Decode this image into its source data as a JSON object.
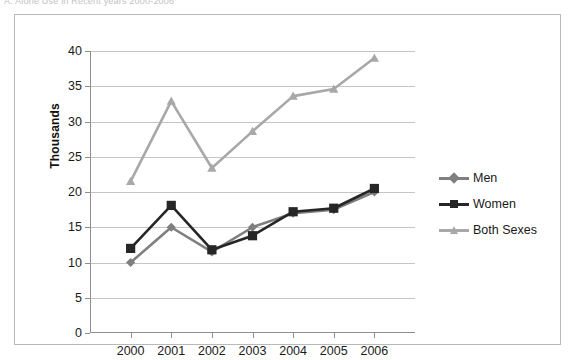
{
  "caption": "A. Alone Use in Recent years 2000-2006",
  "chart_data": {
    "type": "line",
    "title": "",
    "xlabel": "",
    "ylabel": "Thousands",
    "categories": [
      "2000",
      "2001",
      "2002",
      "2003",
      "2004",
      "2005",
      "2006"
    ],
    "ylim": [
      0,
      40
    ],
    "ytick_step": 5,
    "ytick_labels": [
      "0",
      "5",
      "10",
      "15",
      "20",
      "25",
      "30",
      "35",
      "40"
    ],
    "grid": true,
    "legend_position": "right",
    "series": [
      {
        "name": "Men",
        "color": "#7f7f7f",
        "marker": "diamond",
        "values": [
          10.0,
          15.0,
          11.5,
          15.0,
          17.0,
          17.5,
          20.0
        ]
      },
      {
        "name": "Women",
        "color": "#262626",
        "marker": "square",
        "values": [
          12.0,
          18.1,
          11.8,
          13.8,
          17.2,
          17.7,
          20.5
        ]
      },
      {
        "name": "Both Sexes",
        "color": "#a8a8a8",
        "marker": "triangle",
        "values": [
          21.5,
          32.9,
          23.4,
          28.6,
          33.6,
          34.6,
          39.0
        ]
      }
    ]
  },
  "colors": {
    "men": "#7f7f7f",
    "women": "#262626",
    "both_sexes": "#a8a8a8",
    "grid": "#c5c5c5",
    "axis": "#8f8f8f",
    "frame": "#b9b9b9",
    "background": "#ffffff"
  }
}
